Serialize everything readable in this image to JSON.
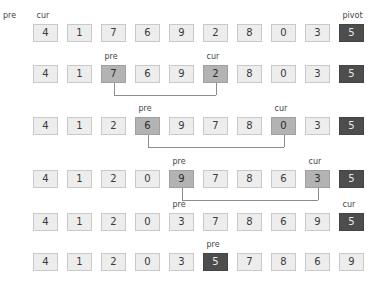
{
  "figure": {
    "box_count_per_row": 10,
    "colors": {
      "background": "#ffffff",
      "cell_fill": "#ededed",
      "cell_border": "#c9c9c9",
      "cell_highlight_fill": "#b3b3b3",
      "pivot_fill": "#4d4d4d",
      "pivot_text": "#e8e8e8",
      "label_text": "#444444",
      "connector": "#8c8c8c"
    }
  },
  "labels": {
    "pre": "pre",
    "cur": "cur",
    "pivot": "pivot"
  },
  "rows": [
    {
      "id": "row-1",
      "y": 24,
      "values": [
        "4",
        "1",
        "7",
        "6",
        "9",
        "2",
        "8",
        "0",
        "3",
        "5"
      ],
      "states": [
        "normal",
        "normal",
        "normal",
        "normal",
        "normal",
        "normal",
        "normal",
        "normal",
        "normal",
        "pivot"
      ],
      "labels_above": [
        {
          "text": "cur",
          "index": 0
        },
        {
          "text": "pivot",
          "index": 9
        }
      ],
      "lead_label": "pre",
      "labels_below": [
        {
          "text": "pre",
          "index": 2
        },
        {
          "text": "cur",
          "index": 5
        }
      ],
      "connector": null
    },
    {
      "id": "row-2",
      "y": 65,
      "values": [
        "4",
        "1",
        "7",
        "6",
        "9",
        "2",
        "8",
        "0",
        "3",
        "5"
      ],
      "states": [
        "normal",
        "normal",
        "highlight",
        "normal",
        "normal",
        "highlight",
        "normal",
        "normal",
        "normal",
        "pivot"
      ],
      "labels_above": [
        {
          "text": "pre",
          "index": 2
        },
        {
          "text": "cur",
          "index": 5
        }
      ],
      "lead_label": null,
      "labels_below": [
        {
          "text": "pre",
          "index": 3
        },
        {
          "text": "cur",
          "index": 7
        }
      ],
      "connector": {
        "from": 2,
        "to": 5
      }
    },
    {
      "id": "row-3",
      "y": 117,
      "values": [
        "4",
        "1",
        "2",
        "6",
        "9",
        "7",
        "8",
        "0",
        "3",
        "5"
      ],
      "states": [
        "normal",
        "normal",
        "normal",
        "highlight",
        "normal",
        "normal",
        "normal",
        "highlight",
        "normal",
        "pivot"
      ],
      "labels_above": [
        {
          "text": "pre",
          "index": 3
        },
        {
          "text": "cur",
          "index": 7
        }
      ],
      "lead_label": null,
      "labels_below": [
        {
          "text": "pre",
          "index": 4
        },
        {
          "text": "cur",
          "index": 8
        }
      ],
      "connector": {
        "from": 3,
        "to": 7
      }
    },
    {
      "id": "row-4",
      "y": 170,
      "values": [
        "4",
        "1",
        "2",
        "0",
        "9",
        "7",
        "8",
        "6",
        "3",
        "5"
      ],
      "states": [
        "normal",
        "normal",
        "normal",
        "normal",
        "highlight",
        "normal",
        "normal",
        "normal",
        "highlight",
        "pivot"
      ],
      "labels_above": [
        {
          "text": "pre",
          "index": 4
        },
        {
          "text": "cur",
          "index": 8
        }
      ],
      "lead_label": null,
      "labels_below": [
        {
          "text": "pre",
          "index": 4
        },
        {
          "text": "cur",
          "index": 9
        }
      ],
      "connector": {
        "from": 4,
        "to": 8
      }
    },
    {
      "id": "row-5",
      "y": 213,
      "values": [
        "4",
        "1",
        "2",
        "0",
        "3",
        "7",
        "8",
        "6",
        "9",
        "5"
      ],
      "states": [
        "normal",
        "normal",
        "normal",
        "normal",
        "normal",
        "normal",
        "normal",
        "normal",
        "normal",
        "pivot"
      ],
      "labels_above": [
        {
          "text": "pre",
          "index": 4
        },
        {
          "text": "cur",
          "index": 9
        }
      ],
      "lead_label": null,
      "labels_below": [
        {
          "text": "pre",
          "index": 5
        }
      ],
      "connector": null
    },
    {
      "id": "row-6",
      "y": 253,
      "values": [
        "4",
        "1",
        "2",
        "0",
        "3",
        "5",
        "7",
        "8",
        "6",
        "9"
      ],
      "states": [
        "normal",
        "normal",
        "normal",
        "normal",
        "normal",
        "pivot",
        "normal",
        "normal",
        "normal",
        "normal"
      ],
      "labels_above": [
        {
          "text": "pre",
          "index": 5
        }
      ],
      "lead_label": null,
      "labels_below": [],
      "connector": null
    }
  ]
}
